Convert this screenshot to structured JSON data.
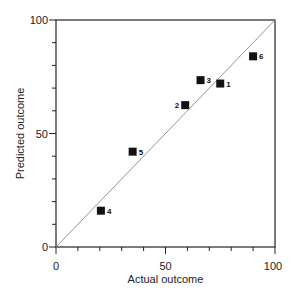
{
  "chart_data": {
    "type": "scatter",
    "title": "",
    "xlabel": "Actual outcome",
    "ylabel": "Predicted outcome",
    "xlim": [
      0,
      100
    ],
    "ylim": [
      0,
      100
    ],
    "x_ticks": [
      0,
      50,
      100
    ],
    "y_ticks": [
      0,
      50,
      100
    ],
    "minor_tick_step": 10,
    "grid": false,
    "legend": null,
    "reference_line": {
      "type": "identity",
      "from": [
        0,
        0
      ],
      "to": [
        100,
        100
      ],
      "color": "#888888"
    },
    "marker": {
      "shape": "square",
      "color": "#111111"
    },
    "points": [
      {
        "label": "1",
        "x": 75,
        "y": 72
      },
      {
        "label": "2",
        "x": 59,
        "y": 62.5
      },
      {
        "label": "3",
        "x": 66,
        "y": 73.5
      },
      {
        "label": "4",
        "x": 20.5,
        "y": 16
      },
      {
        "label": "5",
        "x": 35,
        "y": 42
      },
      {
        "label": "6",
        "x": 90,
        "y": 84
      }
    ]
  },
  "axes": {
    "x": {
      "tick_labels": [
        "0",
        "50",
        "100"
      ],
      "title": "Actual outcome"
    },
    "y": {
      "tick_labels": [
        "0",
        "50",
        "100"
      ],
      "title": "Predicted outcome"
    }
  }
}
